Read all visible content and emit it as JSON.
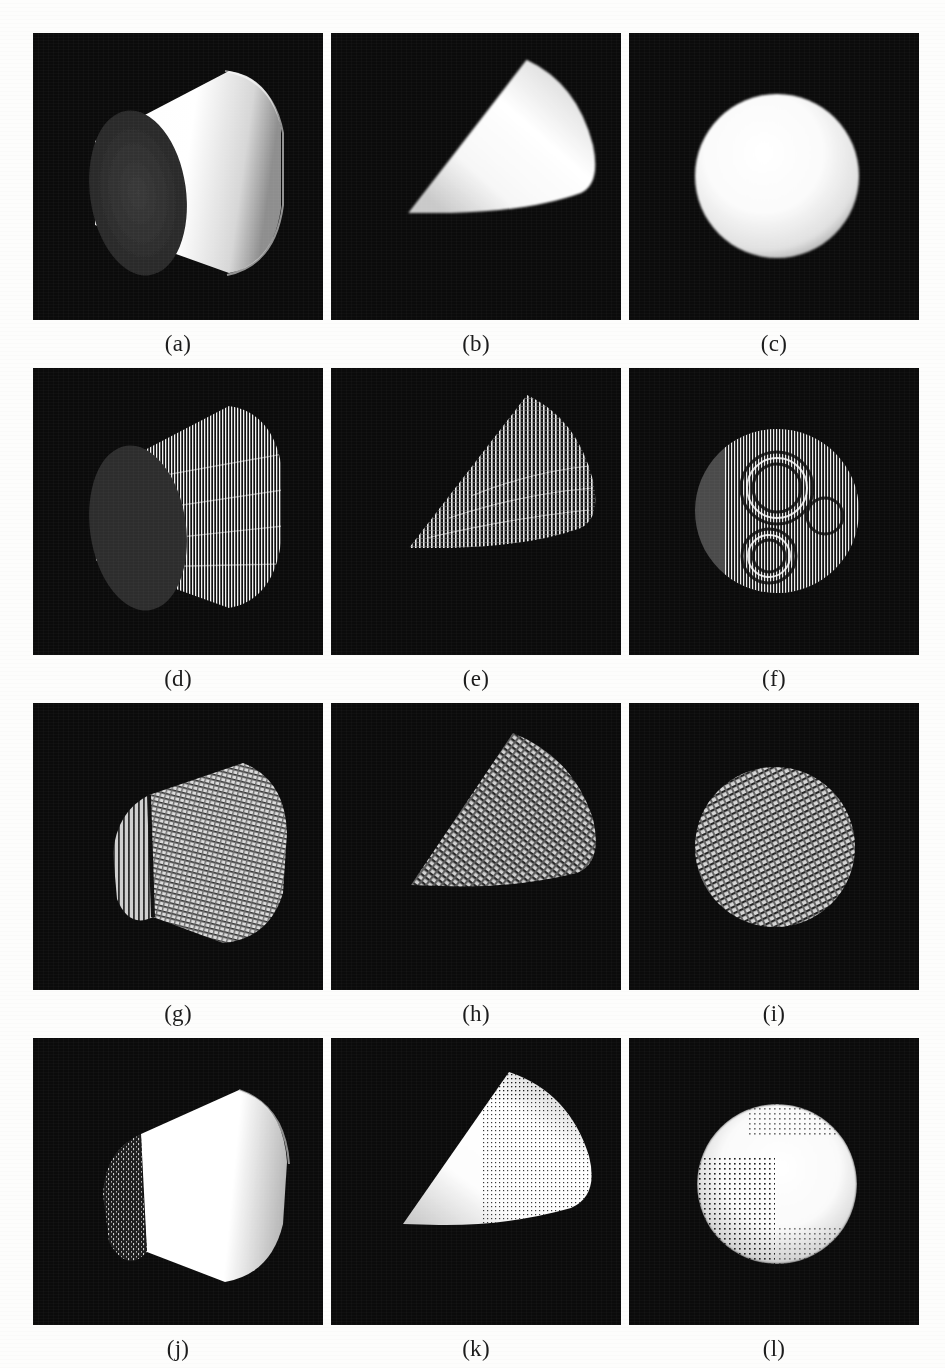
{
  "figure": {
    "cropped_header_text": "",
    "background_color": "#fdfdfc",
    "panel_background_color": "#0a0a0a",
    "caption_color": "#1c1c1c",
    "grid": {
      "rows": 4,
      "columns": 3
    }
  },
  "panels": [
    {
      "caption": "(a)",
      "shape": "cylinder",
      "style": "smooth-shaded",
      "row": 1,
      "column": 1
    },
    {
      "caption": "(b)",
      "shape": "cone",
      "style": "smooth-shaded",
      "row": 1,
      "column": 2
    },
    {
      "caption": "(c)",
      "shape": "sphere",
      "style": "smooth-shaded",
      "row": 1,
      "column": 3
    },
    {
      "caption": "(d)",
      "shape": "cylinder",
      "style": "dithered-striped",
      "row": 2,
      "column": 1
    },
    {
      "caption": "(e)",
      "shape": "cone",
      "style": "dithered-striped",
      "row": 2,
      "column": 2
    },
    {
      "caption": "(f)",
      "shape": "sphere",
      "style": "dithered-banded",
      "row": 2,
      "column": 3
    },
    {
      "caption": "(g)",
      "shape": "cylinder",
      "style": "voxelized",
      "row": 3,
      "column": 1
    },
    {
      "caption": "(h)",
      "shape": "cone",
      "style": "voxelized",
      "row": 3,
      "column": 2
    },
    {
      "caption": "(i)",
      "shape": "sphere",
      "style": "voxelized",
      "row": 3,
      "column": 3
    },
    {
      "caption": "(j)",
      "shape": "cylinder",
      "style": "speckled-noisy",
      "row": 4,
      "column": 1
    },
    {
      "caption": "(k)",
      "shape": "cone",
      "style": "speckled-noisy",
      "row": 4,
      "column": 2
    },
    {
      "caption": "(l)",
      "shape": "sphere",
      "style": "speckled-noisy",
      "row": 4,
      "column": 3
    }
  ]
}
